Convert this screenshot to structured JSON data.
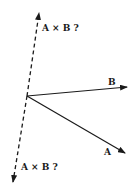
{
  "diagram": {
    "labels": {
      "cross_up": "A × B ?",
      "cross_down": "A × B ?",
      "vector_a": "A",
      "vector_b": "B"
    },
    "colors": {
      "stroke": "#1a1a1a",
      "background": "#ffffff"
    }
  }
}
